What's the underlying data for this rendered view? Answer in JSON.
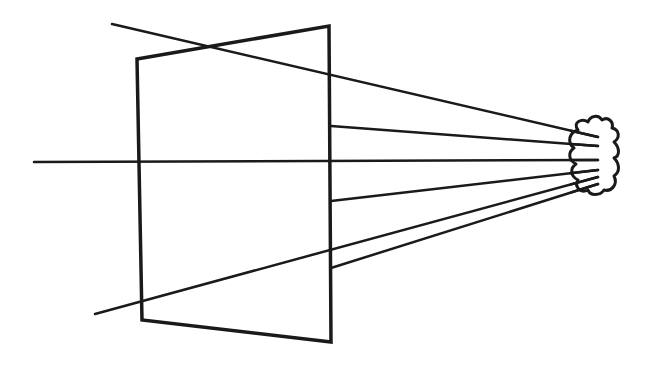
{
  "diagram": {
    "stroke_color": "#1a1a1a",
    "background": "#ffffff",
    "picture_plane": {
      "points": [
        [
          137,
          59
        ],
        [
          329,
          26
        ],
        [
          331,
          342
        ],
        [
          142,
          320
        ]
      ]
    },
    "axis": {
      "x1": 34,
      "y1": 162,
      "x2": 598,
      "y2": 160
    },
    "rays": [
      {
        "name": "ray-top-through",
        "x1": 112,
        "y1": 24,
        "x2": 598,
        "y2": 137
      },
      {
        "name": "ray-upper",
        "x1": 331,
        "y1": 126,
        "x2": 598,
        "y2": 146
      },
      {
        "name": "ray-mid-lower",
        "x1": 331,
        "y1": 201,
        "x2": 598,
        "y2": 170
      },
      {
        "name": "ray-bottom-through",
        "x1": 95,
        "y1": 314,
        "x2": 598,
        "y2": 177
      },
      {
        "name": "ray-lower",
        "x1": 331,
        "y1": 268,
        "x2": 598,
        "y2": 184
      }
    ],
    "object": {
      "name": "cloud-blob",
      "path": "M578,130 C572,122 582,118 588,122 C590,116 598,114 602,120 C608,116 614,122 612,128 C620,130 620,138 614,142 C620,148 620,156 614,158 C620,164 620,172 614,176 C618,184 612,192 604,190 C600,196 590,196 588,190 C580,194 574,186 578,180 C570,176 570,168 576,164 C568,160 568,152 574,148 C566,142 570,132 578,130 Z"
    }
  }
}
